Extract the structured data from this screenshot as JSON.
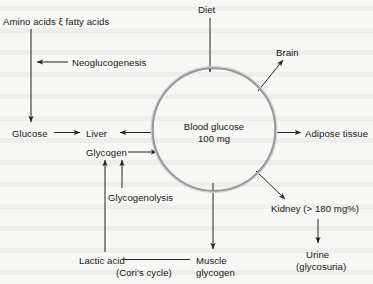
{
  "diagram": {
    "background_color": "#f7f7f5",
    "ink_color": "#1f1f1f",
    "center_node": {
      "name": "blood-glucose-pool",
      "line1": "Blood glucose",
      "line2": "100 mg",
      "shape": "circle",
      "cx": 214,
      "cy": 129,
      "r": 62
    },
    "nodes": [
      {
        "id": "amino-fatty",
        "label": "Amino acids ξ fatty acids",
        "x": 3,
        "y": 16
      },
      {
        "id": "neoglucogenesis",
        "label": "Neoglucogenesis",
        "x": 72,
        "y": 57
      },
      {
        "id": "glucose",
        "label": "Glucose",
        "x": 12,
        "y": 128
      },
      {
        "id": "liver",
        "label": "Liver",
        "x": 86,
        "y": 128
      },
      {
        "id": "diet",
        "label": "Diet",
        "x": 198,
        "y": 4
      },
      {
        "id": "brain",
        "label": "Brain",
        "x": 276,
        "y": 47
      },
      {
        "id": "adipose",
        "label": "Adipose tissue",
        "x": 305,
        "y": 128
      },
      {
        "id": "kidney",
        "label": "Kidney (> 180 mg%)",
        "x": 271,
        "y": 203
      },
      {
        "id": "urine",
        "label": "Urine",
        "x": 306,
        "y": 249
      },
      {
        "id": "glycosuria",
        "label": "(glycosuria)",
        "x": 296,
        "y": 261
      },
      {
        "id": "glycogen",
        "label": "Glycogen",
        "x": 86,
        "y": 147
      },
      {
        "id": "glycogenolysis",
        "label": "Glycogenolysis",
        "x": 108,
        "y": 192
      },
      {
        "id": "lactic-acid",
        "label": "Lactic acid",
        "x": 79,
        "y": 255
      },
      {
        "id": "cori-cycle",
        "label": "(Cori's cycle)",
        "x": 116,
        "y": 267
      },
      {
        "id": "muscle",
        "label": "Muscle",
        "x": 196,
        "y": 255
      },
      {
        "id": "muscle-glycogen",
        "label": "glycogen",
        "x": 196,
        "y": 267
      }
    ],
    "edges": [
      {
        "id": "amino-to-glucose",
        "from": "amino-fatty",
        "to": "glucose",
        "arrowhead": "down"
      },
      {
        "id": "neoglucogenesis-to-path",
        "from": "neoglucogenesis",
        "to": "amino-to-glucose",
        "arrowhead": "left"
      },
      {
        "id": "glucose-to-liver",
        "from": "glucose",
        "to": "liver",
        "arrowhead": "right"
      },
      {
        "id": "pool-to-liver",
        "from": "blood-glucose-pool",
        "to": "liver",
        "arrowhead": "left"
      },
      {
        "id": "diet-to-pool",
        "from": "diet",
        "to": "blood-glucose-pool",
        "arrowhead": "down"
      },
      {
        "id": "pool-to-brain",
        "from": "blood-glucose-pool",
        "to": "brain",
        "arrowhead": "up-right"
      },
      {
        "id": "pool-to-adipose",
        "from": "blood-glucose-pool",
        "to": "adipose",
        "arrowhead": "right"
      },
      {
        "id": "pool-to-kidney",
        "from": "blood-glucose-pool",
        "to": "kidney",
        "arrowhead": "down-right"
      },
      {
        "id": "kidney-to-urine",
        "from": "kidney",
        "to": "urine",
        "arrowhead": "down"
      },
      {
        "id": "pool-to-muscle",
        "from": "blood-glucose-pool",
        "to": "muscle",
        "arrowhead": "down"
      },
      {
        "id": "glycogen-to-pool",
        "from": "glycogen",
        "to": "blood-glucose-pool",
        "arrowhead": "right"
      },
      {
        "id": "glycogenolysis-to-glycogen",
        "from": "glycogenolysis",
        "to": "glycogen",
        "arrowhead": "up"
      },
      {
        "id": "lactic-to-glycogen",
        "from": "lactic-acid",
        "to": "glycogen",
        "arrowhead": "up"
      },
      {
        "id": "lactic-to-muscle",
        "from": "lactic-acid",
        "to": "muscle",
        "arrowhead": "none"
      }
    ]
  }
}
